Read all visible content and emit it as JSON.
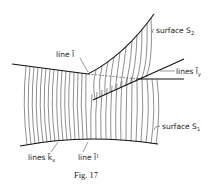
{
  "figure": {
    "caption": "Fig. 17",
    "labels": {
      "surface_s2": "surface S",
      "surface_s2_sub": "2",
      "line_l": "line l̄",
      "lines_ly": "lines l̄",
      "lines_ly_sub": "y",
      "surface_s1": "surface S",
      "surface_s1_sub": "1",
      "lines_kx": "lines k̄",
      "lines_kx_sub": "x",
      "line_l1": "line l̄¹"
    },
    "colors": {
      "ink": "#222222",
      "background": "#ffffff"
    }
  }
}
